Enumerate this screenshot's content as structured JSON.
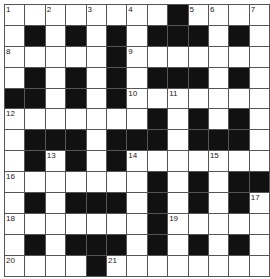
{
  "puzzle": {
    "rows": 13,
    "cols": 13,
    "colors": {
      "block": "#111111",
      "cell": "#ffffff",
      "line": "#555555"
    },
    "layout": [
      "1.2.3.4.#56.7",
      ".#.#.#.###.#.",
      "8....#9......",
      ".#.#.#.###.#.",
      "##.#.#A.B....",
      "C......#.#.#.",
      ".###.###.###.",
      ".#D#.#E...F..",
      "G......#.#.##",
      ".#.###.#.#.#H",
      "I......#J....",
      ".#.###.#.#.#.",
      "K...#L......."
    ],
    "numbers": [
      {
        "r": 0,
        "c": 0,
        "n": "1"
      },
      {
        "r": 0,
        "c": 2,
        "n": "2"
      },
      {
        "r": 0,
        "c": 4,
        "n": "3"
      },
      {
        "r": 0,
        "c": 6,
        "n": "4"
      },
      {
        "r": 0,
        "c": 9,
        "n": "5"
      },
      {
        "r": 0,
        "c": 10,
        "n": "6"
      },
      {
        "r": 0,
        "c": 12,
        "n": "7"
      },
      {
        "r": 2,
        "c": 0,
        "n": "8"
      },
      {
        "r": 2,
        "c": 6,
        "n": "9"
      },
      {
        "r": 4,
        "c": 6,
        "n": "10"
      },
      {
        "r": 4,
        "c": 8,
        "n": "11"
      },
      {
        "r": 5,
        "c": 0,
        "n": "12"
      },
      {
        "r": 7,
        "c": 2,
        "n": "13"
      },
      {
        "r": 7,
        "c": 6,
        "n": "14"
      },
      {
        "r": 7,
        "c": 10,
        "n": "15"
      },
      {
        "r": 8,
        "c": 0,
        "n": "16"
      },
      {
        "r": 9,
        "c": 12,
        "n": "17"
      },
      {
        "r": 10,
        "c": 0,
        "n": "18"
      },
      {
        "r": 10,
        "c": 8,
        "n": "19"
      },
      {
        "r": 12,
        "c": 0,
        "n": "20"
      },
      {
        "r": 12,
        "c": 5,
        "n": "21"
      }
    ]
  }
}
